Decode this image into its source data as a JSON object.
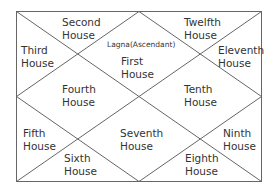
{
  "chart": {
    "lagna_label": "Lagna(Ascendant)",
    "houses": [
      {
        "id": 1,
        "line1": "First",
        "line2": "House"
      },
      {
        "id": 2,
        "line1": "Second",
        "line2": "House"
      },
      {
        "id": 3,
        "line1": "Third",
        "line2": "House"
      },
      {
        "id": 4,
        "line1": "Fourth",
        "line2": "House"
      },
      {
        "id": 5,
        "line1": "Fifth",
        "line2": "House"
      },
      {
        "id": 6,
        "line1": "Sixth",
        "line2": "House"
      },
      {
        "id": 7,
        "line1": "Seventh",
        "line2": "House"
      },
      {
        "id": 8,
        "line1": "Eighth",
        "line2": "House"
      },
      {
        "id": 9,
        "line1": "Ninth",
        "line2": "House"
      },
      {
        "id": 10,
        "line1": "Tenth",
        "line2": "House"
      },
      {
        "id": 11,
        "line1": "Eleventh",
        "line2": "House"
      },
      {
        "id": 12,
        "line1": "Twelfth",
        "line2": "House"
      }
    ],
    "line_color": "#555555"
  }
}
